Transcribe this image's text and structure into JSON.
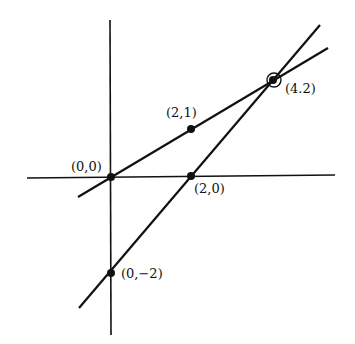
{
  "diagram": {
    "type": "coordinate-plane-two-lines",
    "points": [
      {
        "label": "(0,0)",
        "x": 0,
        "y": 0
      },
      {
        "label": "(2,1)",
        "x": 2,
        "y": 1
      },
      {
        "label": "(2,0)",
        "x": 2,
        "y": 0
      },
      {
        "label": "(0,−2)",
        "x": 0,
        "y": -2
      },
      {
        "label": "(4.2)",
        "x": 4,
        "y": 2,
        "highlighted": true
      }
    ],
    "lines": [
      {
        "name": "line through (0,0) and (2,1)",
        "equation": "y = x/2"
      },
      {
        "name": "line through (0,-2) and (2,0)",
        "equation": "y = x - 2"
      }
    ],
    "colors": {
      "ink": "#111111",
      "background": "#ffffff"
    }
  }
}
